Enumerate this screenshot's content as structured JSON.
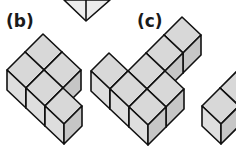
{
  "labels": {
    "b": "(b)",
    "c": "(c)"
  },
  "colors": {
    "top": "#d8d8d8",
    "left": "#dedede",
    "right": "#c6c6c6",
    "stroke": "#111111",
    "background": "#ffffff"
  },
  "geometry": {
    "u": [
      19,
      18
    ],
    "v": [
      -18,
      18
    ],
    "h": 20
  },
  "figures": [
    {
      "name": "figure-a-partial",
      "cells": "tip only (cut off)"
    },
    {
      "name": "figure-b",
      "origin": [
        43,
        34
      ],
      "cells": [
        [
          0,
          0
        ],
        [
          1,
          0
        ],
        [
          0,
          1
        ],
        [
          1,
          1
        ],
        [
          2,
          1
        ]
      ]
    },
    {
      "name": "figure-c",
      "origin": [
        163,
        -1
      ],
      "cells": [
        [
          1,
          0
        ],
        [
          1,
          1
        ],
        [
          1,
          2
        ],
        [
          2,
          2
        ],
        [
          0,
          3
        ],
        [
          1,
          3
        ],
        [
          2,
          3
        ]
      ]
    },
    {
      "name": "figure-d-partial",
      "origin": [
        220,
        88
      ],
      "cells": [
        [
          0,
          -2
        ],
        [
          0,
          -1
        ],
        [
          0,
          0
        ]
      ]
    }
  ]
}
